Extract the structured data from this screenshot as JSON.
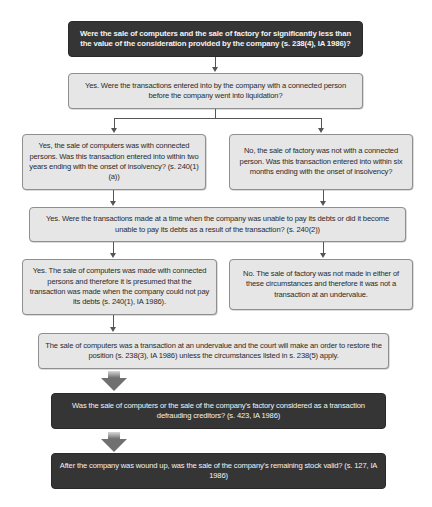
{
  "diagram": {
    "type": "flowchart",
    "colors": {
      "dark_box": "#353535",
      "light_box": "#e6e6e6",
      "arrow": "#555555",
      "big_arrow": "#7a7a7a"
    },
    "nodes": [
      {
        "id": "q1",
        "style": "dark",
        "text": "Were the sale of computers and the sale of factory for significantly less than the value of the consideration provided by the company (s. 238(4), IA 1986)?"
      },
      {
        "id": "q2",
        "style": "light",
        "text": "Yes.  Were the transactions entered into by the company with a connected person before the company went into liquidation?"
      },
      {
        "id": "q3a",
        "style": "light",
        "text": "Yes, the sale of computers was with connected persons. Was this transaction entered into within two years ending with the onset of insolvency? (s. 240(1)(a))"
      },
      {
        "id": "q3b",
        "style": "light",
        "text": "No, the sale of factory was not with a connected person. Was this transaction entered into within six months ending with the onset of insolvency?"
      },
      {
        "id": "q4",
        "style": "light",
        "text": "Yes. Were the transactions made at a time when the company was unable to pay its debts or did it become unable to pay its debts as a result of the transaction?  (s. 240(2))"
      },
      {
        "id": "a5a",
        "style": "light",
        "text": "Yes. The sale of computers was made with connected persons and therefore it is presumed that the transaction was made when the company could not pay its debts (s. 240(1), IA 1986)."
      },
      {
        "id": "a5b",
        "style": "light",
        "text": "No.  The sale of factory was not made in either of these circumstances and therefore it was not a transaction at an undervalue."
      },
      {
        "id": "c6",
        "style": "light",
        "text": "The sale of computers was a transaction at an undervalue and the court will make an order to restore the position (s. 238(3), IA 1986) unless the circumstances listed in s. 238(5) apply."
      },
      {
        "id": "q7",
        "style": "dark",
        "text": "Was the sale of computers or the sale of the company's factory considered as a transaction defrauding creditors? (s. 423, IA 1986)"
      },
      {
        "id": "q8",
        "style": "dark",
        "text": "After the company was wound up, was the sale of the company's remaining stock valid? (s. 127, IA 1986)"
      }
    ],
    "edges": [
      {
        "from": "q1",
        "to": "q2"
      },
      {
        "from": "q2",
        "to": "q3a"
      },
      {
        "from": "q2",
        "to": "q3b"
      },
      {
        "from": "q3a",
        "to": "q4"
      },
      {
        "from": "q3b",
        "to": "q4"
      },
      {
        "from": "q4",
        "to": "a5a"
      },
      {
        "from": "q4",
        "to": "a5b"
      },
      {
        "from": "a5a",
        "to": "c6"
      },
      {
        "from": "c6",
        "to": "q7",
        "style": "big-arrow"
      },
      {
        "from": "q7",
        "to": "q8",
        "style": "big-arrow"
      }
    ]
  }
}
